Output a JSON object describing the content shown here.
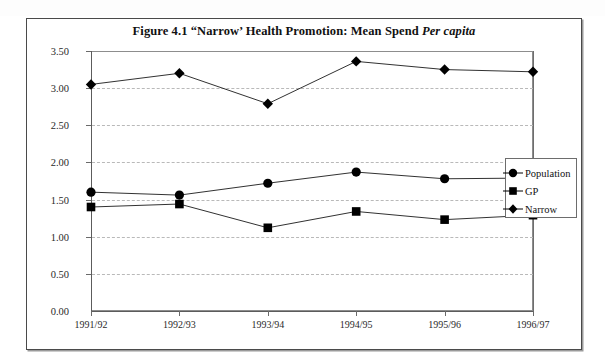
{
  "figure": {
    "title_plain": "Figure 4.1 “Narrow’ Health Promotion: Mean Spend ",
    "title_italic": "Per capita",
    "title_full": "Figure 4.1 “Narrow’ Health Promotion: Mean Spend Per capita"
  },
  "legend": {
    "position": "right",
    "items": [
      {
        "label": "Population",
        "marker": "circle-marker-icon",
        "color": "#000000"
      },
      {
        "label": "GP",
        "marker": "square-marker-icon",
        "color": "#000000"
      },
      {
        "label": "Narrow",
        "marker": "diamond-marker-icon",
        "color": "#000000"
      }
    ]
  },
  "axes": {
    "y_ticks": [
      "0.00",
      "0.50",
      "1.00",
      "1.50",
      "2.00",
      "2.50",
      "3.00",
      "3.50"
    ],
    "x_ticks": [
      "1991/92",
      "1992/93",
      "1993/94",
      "1994/95",
      "1995/96",
      "1996/97"
    ]
  },
  "chart_data": {
    "type": "line",
    "title": "Figure 4.1 “Narrow’ Health Promotion: Mean Spend Per capita",
    "xlabel": "",
    "ylabel": "",
    "categories": [
      "1991/92",
      "1992/93",
      "1993/94",
      "1994/95",
      "1995/96",
      "1996/97"
    ],
    "series": [
      {
        "name": "Population",
        "marker": "circle",
        "values": [
          1.6,
          1.56,
          1.72,
          1.87,
          1.78,
          1.79
        ]
      },
      {
        "name": "GP",
        "marker": "square",
        "values": [
          1.4,
          1.44,
          1.12,
          1.34,
          1.23,
          1.29
        ]
      },
      {
        "name": "Narrow",
        "marker": "diamond",
        "values": [
          3.05,
          3.2,
          2.79,
          3.36,
          3.25,
          3.22
        ]
      }
    ],
    "ylim": [
      0.0,
      3.5
    ],
    "ytick_step": 0.5,
    "grid": true,
    "grid_style": "dashed",
    "grid_color": "#b9b9b9",
    "legend_position": "right"
  }
}
